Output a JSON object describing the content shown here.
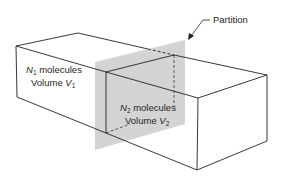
{
  "diagram": {
    "type": "isometric-box-partition",
    "colors": {
      "line": "#222222",
      "partition_fill": "#d4d4d4",
      "background": "#ffffff"
    },
    "callout": {
      "text": "Partition"
    },
    "left_region": {
      "count_symbol": "N",
      "count_subscript": "1",
      "count_suffix": " molecules",
      "volume_prefix": "Volume ",
      "volume_symbol": "V",
      "volume_subscript": "1"
    },
    "right_region": {
      "count_symbol": "N",
      "count_subscript": "2",
      "count_suffix": " molecules",
      "volume_prefix": "Volume ",
      "volume_symbol": "V",
      "volume_subscript": "2"
    }
  }
}
